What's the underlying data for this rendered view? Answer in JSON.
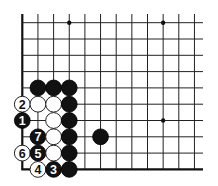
{
  "diagram": {
    "type": "go-board-problem",
    "board_segment": "lower-left corner",
    "colors": {
      "background": "#ffffff",
      "line": "#222222",
      "black_stone": "#111111",
      "white_stone": "#ffffff"
    },
    "grid": {
      "columns": 12,
      "rows": 10,
      "origin_x": 22.3,
      "origin_y": 22.7,
      "col_spacing": 15.65,
      "row_spacing": 16.3,
      "line_top": 14,
      "line_right": 203,
      "edges": [
        "left",
        "bottom"
      ]
    },
    "star_points": [
      {
        "col": 3,
        "row": 0
      },
      {
        "col": 9,
        "row": 0
      },
      {
        "col": 9,
        "row": 6
      }
    ],
    "stones": [
      {
        "col": 1,
        "row": 4,
        "color": "black",
        "label": ""
      },
      {
        "col": 2,
        "row": 4,
        "color": "black",
        "label": ""
      },
      {
        "col": 3,
        "row": 4,
        "color": "black",
        "label": ""
      },
      {
        "col": 0,
        "row": 5,
        "color": "white",
        "label": "2"
      },
      {
        "col": 1,
        "row": 5,
        "color": "white",
        "label": ""
      },
      {
        "col": 2,
        "row": 5,
        "color": "white",
        "label": ""
      },
      {
        "col": 3,
        "row": 5,
        "color": "black",
        "label": ""
      },
      {
        "col": 0,
        "row": 6,
        "color": "black",
        "label": "1"
      },
      {
        "col": 2,
        "row": 6,
        "color": "white",
        "label": ""
      },
      {
        "col": 3,
        "row": 6,
        "color": "black",
        "label": ""
      },
      {
        "col": 1,
        "row": 7,
        "color": "black",
        "label": "7"
      },
      {
        "col": 2,
        "row": 7,
        "color": "white",
        "label": ""
      },
      {
        "col": 3,
        "row": 7,
        "color": "black",
        "label": ""
      },
      {
        "col": 5,
        "row": 7,
        "color": "black",
        "label": ""
      },
      {
        "col": 0,
        "row": 8,
        "color": "white",
        "label": "6"
      },
      {
        "col": 1,
        "row": 8,
        "color": "black",
        "label": "5"
      },
      {
        "col": 2,
        "row": 8,
        "color": "white",
        "label": ""
      },
      {
        "col": 3,
        "row": 8,
        "color": "black",
        "label": ""
      },
      {
        "col": 1,
        "row": 9,
        "color": "white",
        "label": "4"
      },
      {
        "col": 2,
        "row": 9,
        "color": "black",
        "label": "3"
      },
      {
        "col": 3,
        "row": 9,
        "color": "black",
        "label": ""
      }
    ],
    "move_sequence": [
      {
        "move": "1",
        "color": "black"
      },
      {
        "move": "2",
        "color": "white"
      },
      {
        "move": "3",
        "color": "black"
      },
      {
        "move": "4",
        "color": "white"
      },
      {
        "move": "5",
        "color": "black"
      },
      {
        "move": "6",
        "color": "white"
      },
      {
        "move": "7",
        "color": "black"
      }
    ]
  }
}
